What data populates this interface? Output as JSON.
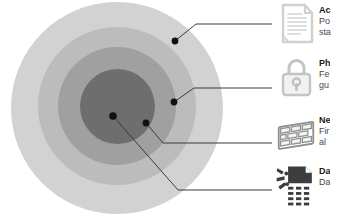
{
  "diagram": {
    "type": "concentric-rings-callout",
    "rings": [
      {
        "name": "outer-ring",
        "color": "#d2d2d2"
      },
      {
        "name": "second-ring",
        "color": "#bcbcbc"
      },
      {
        "name": "third-ring",
        "color": "#a0a0a0"
      },
      {
        "name": "core-ring",
        "color": "#6e6e6e"
      }
    ],
    "marker_color": "#111111",
    "leader_line_color": "#3a3a3a",
    "background": "#ffffff"
  },
  "callouts": [
    {
      "icon": "document-icon",
      "icon_color": "#d8d8d8",
      "title": "Ac",
      "desc_line1": "Po",
      "desc_line2": "sta"
    },
    {
      "icon": "padlock-icon",
      "icon_color": "#c9c9c9",
      "title": "Ph",
      "desc_line1": "Fe",
      "desc_line2": "gu"
    },
    {
      "icon": "brick-wall-icon",
      "icon_color": "#9a9a9a",
      "title": "Ne",
      "desc_line1": "Fir",
      "desc_line2": "al"
    },
    {
      "icon": "shredded-data-icon",
      "icon_color": "#3d3d3d",
      "title": "Da",
      "desc_line1": "Da",
      "desc_line2": ""
    }
  ]
}
